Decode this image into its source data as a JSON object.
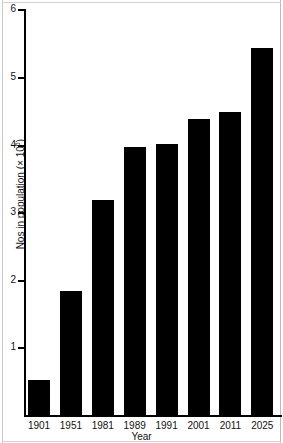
{
  "chart_data": {
    "type": "bar",
    "title": "",
    "subtitle": "",
    "xlabel": "Year",
    "ylabel": "Nos in population (× 10⁶)",
    "ylabel_prefix": "Nos in population (× 10",
    "ylabel_exponent": "6",
    "ylabel_suffix": ")",
    "categories": [
      "1901",
      "1951",
      "1981",
      "1989",
      "1991",
      "2001",
      "2011",
      "2025"
    ],
    "values": [
      0.53,
      1.85,
      3.2,
      3.98,
      4.03,
      4.4,
      4.5,
      5.45
    ],
    "series": [
      {
        "name": "Nos in population",
        "values": [
          0.53,
          1.85,
          3.2,
          3.98,
          4.03,
          4.4,
          4.5,
          5.45
        ]
      }
    ],
    "ylim": [
      0,
      6
    ],
    "yticks": [
      1,
      2,
      3,
      4,
      5,
      6
    ],
    "ytick_labels": [
      "1",
      "2",
      "3",
      "4",
      "5",
      "6"
    ],
    "xtick_labels": [
      "1901",
      "1951",
      "1981",
      "1989",
      "1991",
      "2001",
      "2011",
      "2025"
    ],
    "grid": false,
    "legend": false,
    "legend_position": "none",
    "bar_color": "#000000",
    "axis_color": "#000000",
    "background_color": "#ffffff",
    "units": "millions",
    "annotations": []
  },
  "axes": {
    "y": {
      "ticks": [
        {
          "value": 6,
          "label": "6"
        },
        {
          "value": 5,
          "label": "5"
        },
        {
          "value": 4,
          "label": "4"
        },
        {
          "value": 3,
          "label": "3"
        },
        {
          "value": 2,
          "label": "2"
        },
        {
          "value": 1,
          "label": "1"
        }
      ]
    },
    "x": {
      "ticks": [
        {
          "label": "1901"
        },
        {
          "label": "1951"
        },
        {
          "label": "1981"
        },
        {
          "label": "1989"
        },
        {
          "label": "1991"
        },
        {
          "label": "2001"
        },
        {
          "label": "2011"
        },
        {
          "label": "2025"
        }
      ]
    }
  }
}
